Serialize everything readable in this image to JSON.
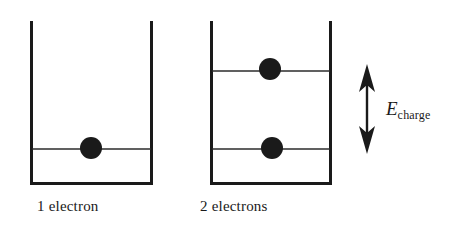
{
  "figure": {
    "background_color": "#ffffff",
    "stroke_color": "#1a1a1a",
    "electron_fill": "#1a1a1a",
    "width": 471,
    "height": 235
  },
  "wells": [
    {
      "id": "well-one-electron",
      "caption": "1 electron",
      "left_x": 30,
      "right_x": 153,
      "top_y": 21,
      "bottom_y": 185,
      "wall_width": 3,
      "levels": [
        {
          "id": "level-ground-left",
          "y": 149,
          "occupied": true
        }
      ],
      "electrons": [
        {
          "id": "electron-1",
          "cx": 91,
          "cy": 148,
          "r": 11
        }
      ]
    },
    {
      "id": "well-two-electrons",
      "caption": "2 electrons",
      "left_x": 210,
      "right_x": 332,
      "top_y": 21,
      "bottom_y": 185,
      "wall_width": 3,
      "levels": [
        {
          "id": "level-excited-right",
          "y": 71,
          "occupied": true
        },
        {
          "id": "level-ground-right",
          "y": 149,
          "occupied": true
        }
      ],
      "electrons": [
        {
          "id": "electron-2",
          "cx": 270,
          "cy": 69,
          "r": 11
        },
        {
          "id": "electron-3",
          "cx": 272,
          "cy": 148,
          "r": 11
        }
      ]
    }
  ],
  "annotation": {
    "arrow": {
      "id": "charging-energy-arrow",
      "x": 367,
      "top_y": 65,
      "bottom_y": 153,
      "double_headed": true,
      "shaft_width": 2.4,
      "head_width": 16,
      "head_length": 22
    },
    "label": {
      "symbol": "E",
      "subscript": "charge",
      "full_text": "E_charge"
    }
  },
  "captions": {
    "left": "1 electron",
    "right": "2 electrons"
  }
}
